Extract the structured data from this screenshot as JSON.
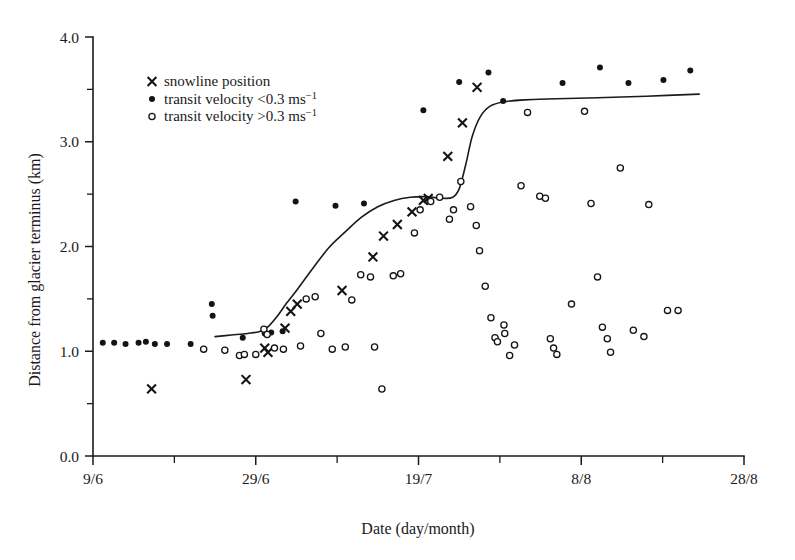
{
  "chart_data": {
    "type": "scatter",
    "title": "",
    "xlabel": "Date (day/month)",
    "ylabel": "Distance from glacier terminus (km)",
    "xlim": [
      0,
      80
    ],
    "ylim": [
      0.0,
      4.0
    ],
    "grid": false,
    "legend_position": "top-left-inside",
    "x_tick_labels": [
      "9/6",
      "29/6",
      "19/7",
      "8/8",
      "28/8"
    ],
    "x_tick_values": [
      0,
      20,
      40,
      60,
      80
    ],
    "x_minor_tick_values": [
      10,
      30,
      50,
      70
    ],
    "x_axis_note": "x measured in days after 9 June; major ticks every 20 days, minor ticks every 10 days",
    "y_tick_labels": [
      "0.0",
      "1.0",
      "2.0",
      "3.0",
      "4.0"
    ],
    "y_tick_values": [
      0.0,
      1.0,
      2.0,
      3.0,
      4.0
    ],
    "y_minor_tick_values": [
      0.5,
      1.5,
      2.5,
      3.5
    ],
    "series": [
      {
        "name": "snowline position",
        "marker": "cross",
        "points": [
          [
            7.2,
            0.64
          ],
          [
            18.8,
            0.73
          ],
          [
            21.1,
            1.03
          ],
          [
            21.5,
            0.99
          ],
          [
            23.6,
            1.22
          ],
          [
            24.3,
            1.38
          ],
          [
            25.1,
            1.45
          ],
          [
            30.6,
            1.58
          ],
          [
            34.4,
            1.9
          ],
          [
            35.7,
            2.1
          ],
          [
            37.4,
            2.21
          ],
          [
            39.2,
            2.33
          ],
          [
            40.6,
            2.44
          ],
          [
            41.2,
            2.46
          ],
          [
            43.6,
            2.86
          ],
          [
            45.4,
            3.18
          ],
          [
            47.2,
            3.52
          ]
        ]
      },
      {
        "name": "transit velocity <0.3 ms⁻¹",
        "marker": "filled-circle",
        "points": [
          [
            1.2,
            1.08
          ],
          [
            2.6,
            1.08
          ],
          [
            4.0,
            1.07
          ],
          [
            5.6,
            1.08
          ],
          [
            6.5,
            1.09
          ],
          [
            7.6,
            1.07
          ],
          [
            9.1,
            1.07
          ],
          [
            12.0,
            1.07
          ],
          [
            14.6,
            1.45
          ],
          [
            14.7,
            1.34
          ],
          [
            18.4,
            1.13
          ],
          [
            21.1,
            1.17
          ],
          [
            21.9,
            1.18
          ],
          [
            23.3,
            1.19
          ],
          [
            24.9,
            2.43
          ],
          [
            29.8,
            2.39
          ],
          [
            33.3,
            2.41
          ],
          [
            40.6,
            3.3
          ],
          [
            45.0,
            3.57
          ],
          [
            48.6,
            3.66
          ],
          [
            50.4,
            3.39
          ],
          [
            57.7,
            3.56
          ],
          [
            62.3,
            3.71
          ],
          [
            65.8,
            3.56
          ],
          [
            70.1,
            3.59
          ],
          [
            73.4,
            3.68
          ]
        ]
      },
      {
        "name": "transit velocity >0.3 ms⁻¹",
        "marker": "open-circle",
        "points": [
          [
            13.6,
            1.02
          ],
          [
            16.2,
            1.01
          ],
          [
            18.0,
            0.96
          ],
          [
            18.6,
            0.97
          ],
          [
            20.0,
            0.97
          ],
          [
            21.0,
            1.21
          ],
          [
            21.4,
            1.16
          ],
          [
            22.3,
            1.03
          ],
          [
            23.4,
            1.02
          ],
          [
            25.5,
            1.05
          ],
          [
            26.2,
            1.5
          ],
          [
            27.3,
            1.52
          ],
          [
            28.0,
            1.17
          ],
          [
            29.4,
            1.02
          ],
          [
            31.0,
            1.04
          ],
          [
            31.8,
            1.49
          ],
          [
            32.9,
            1.73
          ],
          [
            34.1,
            1.71
          ],
          [
            34.6,
            1.04
          ],
          [
            35.5,
            0.64
          ],
          [
            36.9,
            1.72
          ],
          [
            37.8,
            1.74
          ],
          [
            39.5,
            2.13
          ],
          [
            40.2,
            2.35
          ],
          [
            41.5,
            2.43
          ],
          [
            42.6,
            2.47
          ],
          [
            43.8,
            2.26
          ],
          [
            44.3,
            2.35
          ],
          [
            45.2,
            2.62
          ],
          [
            46.4,
            2.38
          ],
          [
            47.1,
            2.2
          ],
          [
            47.5,
            1.96
          ],
          [
            48.2,
            1.62
          ],
          [
            48.9,
            1.32
          ],
          [
            49.4,
            1.13
          ],
          [
            49.7,
            1.09
          ],
          [
            50.5,
            1.25
          ],
          [
            50.6,
            1.17
          ],
          [
            51.2,
            0.96
          ],
          [
            51.8,
            1.06
          ],
          [
            52.6,
            2.58
          ],
          [
            53.4,
            3.28
          ],
          [
            54.9,
            2.48
          ],
          [
            55.6,
            2.46
          ],
          [
            56.2,
            1.12
          ],
          [
            56.6,
            1.03
          ],
          [
            57.0,
            0.97
          ],
          [
            58.8,
            1.45
          ],
          [
            60.4,
            3.29
          ],
          [
            61.2,
            2.41
          ],
          [
            62.0,
            1.71
          ],
          [
            62.6,
            1.23
          ],
          [
            63.2,
            1.12
          ],
          [
            63.6,
            0.99
          ],
          [
            64.8,
            2.75
          ],
          [
            66.4,
            1.2
          ],
          [
            67.7,
            1.14
          ],
          [
            68.3,
            2.4
          ],
          [
            70.6,
            1.39
          ],
          [
            71.9,
            1.39
          ]
        ]
      }
    ],
    "trend_line": {
      "name": "fitted snowline retreat curve",
      "points": [
        [
          15.0,
          1.14
        ],
        [
          17.0,
          1.155
        ],
        [
          19.0,
          1.17
        ],
        [
          20.6,
          1.19
        ],
        [
          21.6,
          1.24
        ],
        [
          22.6,
          1.33
        ],
        [
          23.8,
          1.46
        ],
        [
          25.2,
          1.6
        ],
        [
          27.0,
          1.79
        ],
        [
          29.0,
          1.99
        ],
        [
          31.0,
          2.14
        ],
        [
          33.0,
          2.28
        ],
        [
          35.0,
          2.38
        ],
        [
          37.0,
          2.44
        ],
        [
          39.0,
          2.47
        ],
        [
          41.0,
          2.475
        ],
        [
          43.0,
          2.46
        ],
        [
          44.2,
          2.47
        ],
        [
          45.0,
          2.55
        ],
        [
          45.8,
          2.78
        ],
        [
          46.6,
          3.05
        ],
        [
          47.6,
          3.24
        ],
        [
          48.8,
          3.34
        ],
        [
          50.4,
          3.38
        ],
        [
          53.0,
          3.4
        ],
        [
          57.0,
          3.41
        ],
        [
          62.0,
          3.42
        ],
        [
          68.0,
          3.435
        ],
        [
          74.5,
          3.455
        ]
      ]
    }
  },
  "legend": {
    "items": [
      {
        "marker": "cross",
        "label": "snowline position",
        "sup": ""
      },
      {
        "marker": "filled-circle",
        "label": "transit velocity <0.3 ms",
        "sup": "−1"
      },
      {
        "marker": "open-circle",
        "label": "transit velocity >0.3 ms",
        "sup": "−1"
      }
    ]
  },
  "colors": {
    "ink": "#1a1a1a",
    "background": "#ffffff"
  }
}
